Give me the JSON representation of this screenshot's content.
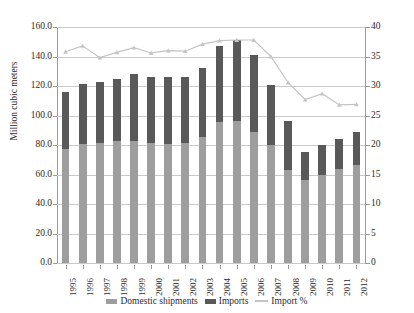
{
  "chart_data": {
    "type": "bar",
    "subtype": "stacked-bar-with-line",
    "title": "",
    "xlabel": "",
    "ylabel": "Million cubic meters",
    "ylabel_right": "",
    "ylim": [
      0,
      160
    ],
    "ylim_right": [
      0,
      40
    ],
    "yticks": [
      "0.0",
      "20.0",
      "40.0",
      "60.0",
      "80.0",
      "100.0",
      "120.0",
      "140.0",
      "160.0"
    ],
    "yticks_right": [
      "0",
      "5",
      "10",
      "15",
      "20",
      "25",
      "30",
      "35",
      "40"
    ],
    "grid": true,
    "legend_position": "bottom",
    "categories": [
      "1995",
      "1996",
      "1997",
      "1998",
      "1999",
      "2000",
      "2001",
      "2002",
      "2003",
      "2004",
      "2005",
      "2006",
      "2007",
      "2008",
      "2009",
      "2010",
      "2011",
      "2012"
    ],
    "series": [
      {
        "name": "Domestic shipments",
        "axis": "left",
        "color": "#9e9e9e",
        "values": [
          77.0,
          80.5,
          81.5,
          82.5,
          83.0,
          81.5,
          81.0,
          81.5,
          85.5,
          95.5,
          96.5,
          89.0,
          80.0,
          63.0,
          56.5,
          59.5,
          63.5,
          66.5
        ]
      },
      {
        "name": "Imports",
        "axis": "left",
        "color": "#595959",
        "values": [
          39.0,
          41.0,
          41.5,
          42.0,
          45.0,
          44.5,
          45.0,
          44.5,
          46.5,
          51.5,
          54.5,
          52.0,
          41.0,
          33.0,
          19.0,
          20.5,
          20.5,
          22.0
        ]
      },
      {
        "name": "Total",
        "axis": "left",
        "derived": true,
        "values": [
          116.0,
          121.5,
          123.0,
          124.5,
          128.0,
          126.0,
          126.0,
          126.0,
          132.0,
          147.0,
          151.0,
          141.0,
          121.0,
          96.0,
          75.5,
          80.0,
          84.0,
          88.5
        ]
      },
      {
        "name": "Import %",
        "axis": "right",
        "color": "#c4c4c4",
        "values": [
          35.8,
          36.8,
          34.8,
          35.7,
          36.5,
          35.6,
          36.0,
          35.9,
          37.1,
          37.7,
          37.8,
          37.8,
          35.0,
          30.6,
          27.7,
          28.7,
          26.8,
          26.9
        ]
      }
    ],
    "legend": [
      {
        "label": "Domestic shipments",
        "marker": "square",
        "color": "#9e9e9e"
      },
      {
        "label": "Imports",
        "marker": "square",
        "color": "#595959"
      },
      {
        "label": "Import %",
        "marker": "line",
        "color": "#c4c4c4"
      }
    ]
  }
}
